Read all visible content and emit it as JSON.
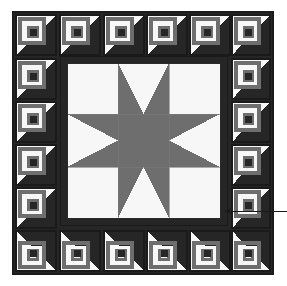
{
  "figure": {
    "title": "Log Cabin Star Medallion Quilt Block Diagram",
    "width": 287,
    "height": 286
  },
  "colors": {
    "background": "#ffffff",
    "dark": "#262626",
    "medium_gray": "#6e6e6e",
    "light": "#f7f7f7",
    "outline": "#1a1a1a",
    "leader_line": "#1a1a1a"
  },
  "quilt": {
    "outer_frame": {
      "x": 13,
      "y": 12,
      "width": 260,
      "height": 262,
      "border_width": 3,
      "border_color": "#262626",
      "label": "quilt-outer-frame"
    },
    "inner_frame": {
      "x": 60,
      "y": 56,
      "width": 167,
      "height": 169,
      "border_width": 6,
      "border_color": "#262626",
      "label": "medallion-inner-frame"
    },
    "border_grid": {
      "columns": 6,
      "rows": 6,
      "block_size": 43,
      "total_blocks": 20,
      "block_type": "log-cabin",
      "description": "Log cabin blocks forming a pieced border around the central star medallion"
    },
    "log_cabin_block": {
      "rounds": 4,
      "center_square": "dark",
      "light_side": "light",
      "dark_side": "dark",
      "strip_width": 4
    }
  },
  "star_medallion": {
    "type": "sawtooth-star",
    "grid": 3,
    "cell_size": 52,
    "center_square_color": "#6e6e6e",
    "corner_square_color": "#f7f7f7",
    "star_point_color": "#6e6e6e",
    "background_color": "#f7f7f7",
    "points": 8,
    "x": 67,
    "y": 63,
    "width": 153,
    "height": 155
  },
  "annotation": {
    "leader_line": {
      "from_x": 287,
      "from_y": 211,
      "to_x": 224,
      "to_y": 211,
      "arrowhead": "left",
      "label": "callout pointing to a log cabin border block"
    },
    "callout_text": ""
  }
}
